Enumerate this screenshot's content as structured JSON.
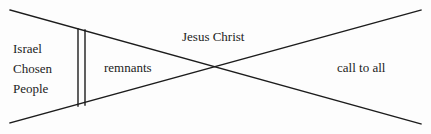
{
  "diagram": {
    "type": "x-crossing-schematic",
    "background_color": "#fdfdfd",
    "line_color": "#1c1c1c",
    "text_color": "#1c1c1c",
    "labels": {
      "israel_line1": "Israel",
      "israel_line2": "Chosen",
      "israel_line3": "People",
      "remnants": "remnants",
      "jesus_christ": "Jesus Christ",
      "call_to_all": "call to all"
    },
    "geometry": {
      "width": 431,
      "height": 134,
      "descending_diagonal": {
        "x1": 10,
        "y1": 10,
        "x2": 421,
        "y2": 124
      },
      "ascending_diagonal": {
        "x1": 10,
        "y1": 123,
        "x2": 421,
        "y2": 10
      },
      "crossing_point": {
        "x": 218,
        "y": 68
      },
      "vertical_line_1_x": 78,
      "vertical_line_2_x": 85,
      "vertical_line_top_y": 29,
      "vertical_line_bottom_y": 106,
      "stroke_width": 1.4
    }
  }
}
